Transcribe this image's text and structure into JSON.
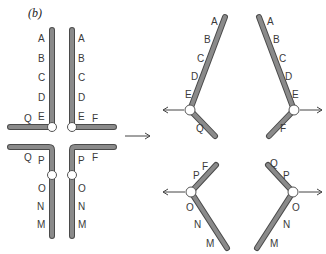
{
  "panel_label": "(b)",
  "labels": {
    "A": "A",
    "B": "B",
    "C": "C",
    "D": "D",
    "E": "E",
    "F": "F",
    "M": "M",
    "N": "N",
    "O": "O",
    "P": "P",
    "Q": "Q"
  },
  "colors": {
    "bar_fill": "#8a8a8a",
    "bar_outline": "#4a4a4a",
    "hinge": "#ffffff",
    "text": "#3a3a3a"
  }
}
